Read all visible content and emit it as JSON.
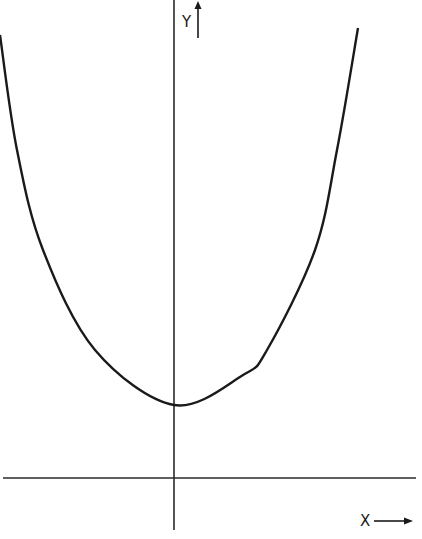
{
  "chart_data": {
    "type": "line",
    "title": "",
    "xlabel": "X",
    "ylabel": "Y",
    "axes": {
      "x_axis": {
        "label": "X",
        "arrow": "right"
      },
      "y_axis": {
        "label": "Y",
        "arrow": "up"
      },
      "ticks": false,
      "grid": false
    },
    "series": [
      {
        "name": "parabola",
        "pixel_points": [
          [
            0,
            35
          ],
          [
            17,
            150
          ],
          [
            43,
            250
          ],
          [
            95,
            350
          ],
          [
            174,
            405
          ],
          [
            243,
            375
          ],
          [
            267,
            350
          ],
          [
            315,
            250
          ],
          [
            337,
            150
          ],
          [
            358,
            28
          ]
        ],
        "vertex_pixel": [
          174,
          405
        ]
      }
    ],
    "colors": {
      "line": "#1a1a1a",
      "background": "#ffffff"
    }
  },
  "labels": {
    "x": "X",
    "y": "Y"
  }
}
